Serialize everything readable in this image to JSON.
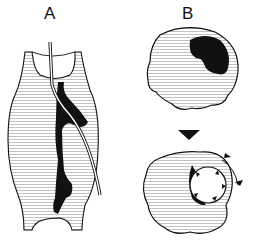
{
  "figure": {
    "panels": [
      {
        "label": "A",
        "description": "Vessel segment with irregular black lumen and inserted catheter"
      },
      {
        "label": "B",
        "description": "Cross-section before and after dilation; black lesion then expanded circular lumen with arrowheads and rotation arrows"
      }
    ],
    "colors": {
      "ink": "#111111",
      "hatch": "#888888",
      "background": "#ffffff"
    },
    "caption_visible": false
  }
}
